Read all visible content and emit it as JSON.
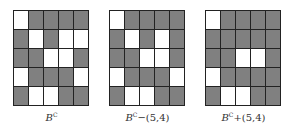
{
  "colors": {
    "gray": "#808080",
    "white": "#ffffff",
    "line": "#222222"
  },
  "panels": [
    {
      "label_base": "B",
      "label_sup": "C",
      "label_op": "",
      "rows": [
        "WGGGG",
        "GWGWW",
        "GGWWG",
        "WGGGW",
        "GWWGG"
      ]
    },
    {
      "label_base": "B",
      "label_sup": "C",
      "label_op": "−(5,4)",
      "rows": [
        "WGGGG",
        "GWGWG",
        "GGWWG",
        "WGGGW",
        "GWWGG"
      ]
    },
    {
      "label_base": "B",
      "label_sup": "C",
      "label_op": "+(5,4)",
      "rows": [
        "WGGGG",
        "GGGGG",
        "GGWWG",
        "WGGGG",
        "GWWGG"
      ]
    }
  ]
}
